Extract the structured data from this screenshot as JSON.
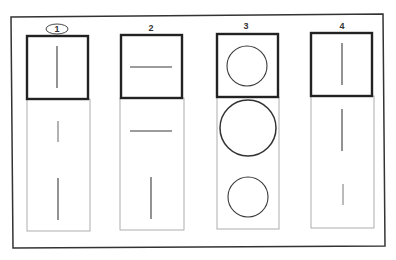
{
  "figure": {
    "frame_color": "#333333",
    "thick_box_color": "#222222",
    "thin_panel_color": "#9a9a9a",
    "stroke_color": "#3a3a3a",
    "columns": [
      {
        "label": "1",
        "label_circled": true,
        "reference": {
          "shape": "vertical-line",
          "length": "long"
        },
        "options": [
          {
            "shape": "vertical-line",
            "length": "short"
          },
          {
            "shape": "vertical-line",
            "length": "long"
          }
        ]
      },
      {
        "label": "2",
        "label_circled": false,
        "reference": {
          "shape": "horizontal-line",
          "length": "medium"
        },
        "options": [
          {
            "shape": "horizontal-line",
            "length": "medium"
          },
          {
            "shape": "vertical-line",
            "length": "medium"
          }
        ]
      },
      {
        "label": "3",
        "label_circled": false,
        "reference": {
          "shape": "circle",
          "size": "medium"
        },
        "options": [
          {
            "shape": "circle",
            "size": "large"
          },
          {
            "shape": "circle",
            "size": "medium"
          }
        ]
      },
      {
        "label": "4",
        "label_circled": false,
        "reference": {
          "shape": "vertical-line",
          "length": "long"
        },
        "options": [
          {
            "shape": "vertical-line",
            "length": "long"
          },
          {
            "shape": "vertical-line",
            "length": "short"
          }
        ]
      }
    ]
  }
}
